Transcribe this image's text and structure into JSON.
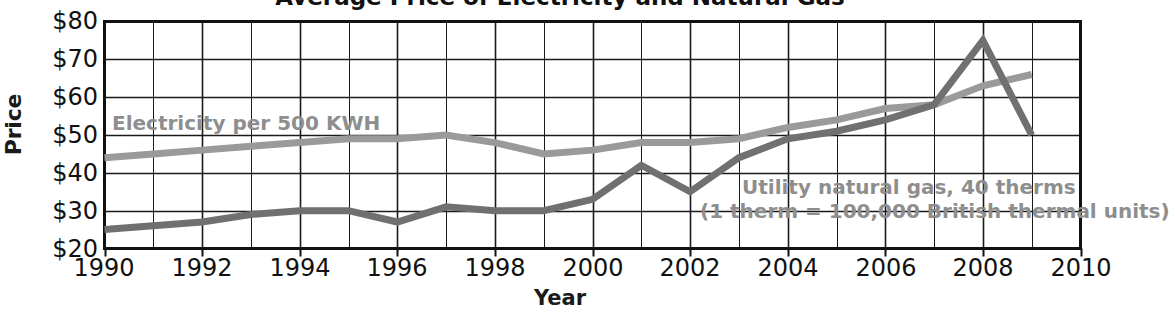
{
  "chart_data": {
    "type": "line",
    "title": "Average Price of Electricity and Natural Gas",
    "xlabel": "Year",
    "ylabel": "Price",
    "x": [
      1990,
      1991,
      1992,
      1993,
      1994,
      1995,
      1996,
      1997,
      1998,
      1999,
      2000,
      2001,
      2002,
      2003,
      2004,
      2005,
      2006,
      2007,
      2008,
      2009
    ],
    "xlim": [
      1990,
      2010
    ],
    "ylim": [
      20,
      80
    ],
    "xticks": [
      "1990",
      "1992",
      "1994",
      "1996",
      "1998",
      "2000",
      "2002",
      "2004",
      "2006",
      "2008",
      "2010"
    ],
    "yticks": [
      "$80",
      "$70",
      "$60",
      "$50",
      "$40",
      "$30",
      "$20"
    ],
    "ytick_values": [
      80,
      70,
      60,
      50,
      40,
      30,
      20
    ],
    "grid": true,
    "legend_position": "inline-annotation",
    "series": [
      {
        "name": "Electricity per 500 KWH",
        "color": "#9a9a9a",
        "label_text": "Electricity per 500 KWH",
        "values": [
          44,
          45,
          46,
          47,
          48,
          49,
          49,
          50,
          48,
          45,
          46,
          48,
          48,
          49,
          52,
          54,
          57,
          58,
          63,
          66
        ]
      },
      {
        "name": "Utility natural gas, 40 therms",
        "color": "#707070",
        "label_text_line1": "Utility natural gas, 40 therms",
        "label_text_line2": "(1 therm = 100,000 British thermal units)",
        "values": [
          25,
          26,
          27,
          29,
          30,
          30,
          27,
          31,
          30,
          30,
          33,
          42,
          35,
          44,
          49,
          51,
          54,
          58,
          75,
          50
        ]
      }
    ]
  },
  "axis": {
    "y_title": "Price",
    "x_title": "Year"
  }
}
